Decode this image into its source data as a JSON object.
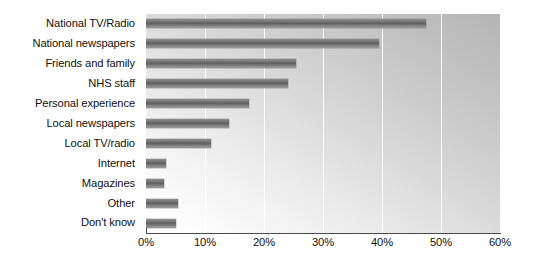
{
  "chart_data": {
    "type": "bar",
    "orientation": "horizontal",
    "title": "",
    "subtitle": "",
    "xlabel": "",
    "ylabel": "",
    "xlim": [
      0,
      60
    ],
    "xtick_step": 10,
    "xtick_labels": [
      "0%",
      "10%",
      "20%",
      "30%",
      "40%",
      "50%",
      "60%"
    ],
    "xtick_values": [
      0,
      10,
      20,
      30,
      40,
      50,
      60
    ],
    "grid": true,
    "grid_axis": "x",
    "grid_color": "#ffffff",
    "legend": false,
    "legend_position": "none",
    "bar_color": "#6e6e6e",
    "plot_background": "#c9c9c9",
    "categories": [
      "National TV/Radio",
      "National newspapers",
      "Friends and family",
      "NHS staff",
      "Personal experience",
      "Local newspapers",
      "Local TV/radio",
      "Internet",
      "Magazines",
      "Other",
      "Don't know"
    ],
    "values": [
      47.5,
      39.5,
      25.5,
      24,
      17.5,
      14,
      11,
      3.4,
      3,
      5.4,
      5
    ],
    "value_unit": "%"
  }
}
